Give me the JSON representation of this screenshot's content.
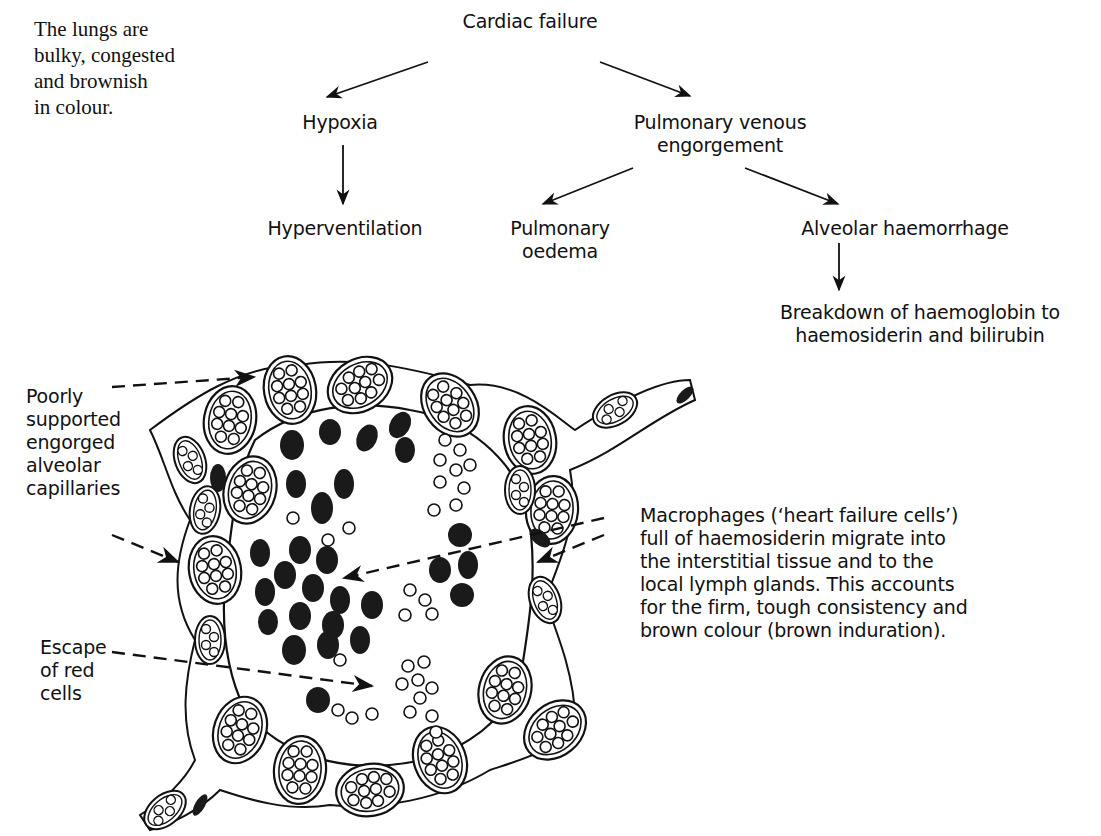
{
  "intro_text": "The lungs are\nbulky, congested\nand brownish\nin colour.",
  "flowchart": {
    "nodes": {
      "cardiac_failure": "Cardiac failure",
      "hypoxia": "Hypoxia",
      "hyperventilation": "Hyperventilation",
      "pulmonary_venous_engorgement": "Pulmonary venous\nengorgement",
      "pulmonary_oedema": "Pulmonary\noedema",
      "alveolar_haemorrhage": "Alveolar haemorrhage",
      "breakdown": "Breakdown of haemoglobin to\nhaemosiderin and bilirubin"
    },
    "edges": [
      [
        "Cardiac failure",
        "Hypoxia"
      ],
      [
        "Cardiac failure",
        "Pulmonary venous engorgement"
      ],
      [
        "Hypoxia",
        "Hyperventilation"
      ],
      [
        "Pulmonary venous engorgement",
        "Pulmonary oedema"
      ],
      [
        "Pulmonary venous engorgement",
        "Alveolar haemorrhage"
      ],
      [
        "Alveolar haemorrhage",
        "Breakdown of haemoglobin to haemosiderin and bilirubin"
      ]
    ]
  },
  "illustration": {
    "subject": "alveolus-cross-section",
    "labels": {
      "capillaries": "Poorly\nsupported\nengorged\nalveolar\ncapillaries",
      "red_cells": "Escape\nof red\ncells",
      "macrophages": "Macrophages (‘heart failure cells’)\nfull of haemosiderin migrate into\nthe interstitial tissue and to the\nlocal lymph glands. This accounts\nfor the firm, tough consistency and\nbrown colour (brown induration)."
    }
  },
  "colors": {
    "ink": "#111111",
    "background": "#ffffff"
  }
}
